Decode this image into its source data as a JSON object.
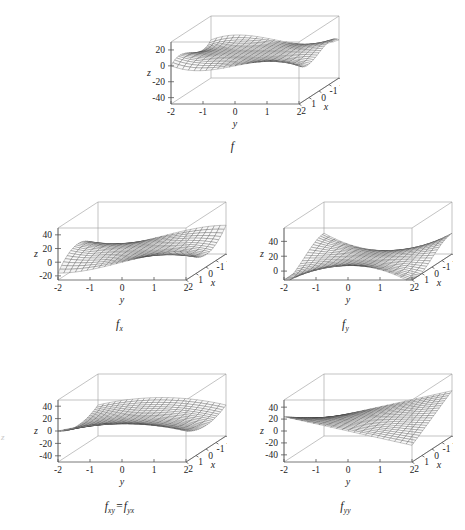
{
  "figure": {
    "title": "",
    "background_color": "#ffffff",
    "edge_artifact_text": "z"
  },
  "chart_data": [
    {
      "id": "f",
      "type": "surface",
      "caption": "f",
      "caption_base": "f",
      "caption_sub": "",
      "function": "f(x,y) = x^3*y - y^3*x",
      "xlabel": "x",
      "ylabel": "y",
      "zlabel": "z",
      "xticks": [
        2,
        1,
        0,
        -1,
        -2
      ],
      "xtick_labels": [
        "2",
        "1",
        "0",
        "-1",
        "-2"
      ],
      "yticks": [
        -2,
        -1,
        0,
        1,
        2
      ],
      "ytick_labels": [
        "-2",
        "-1",
        "0",
        "1",
        "2"
      ],
      "zticks": [
        20,
        0,
        -20,
        -40
      ],
      "ztick_labels": [
        "20",
        "0",
        "-20",
        "-40"
      ],
      "xlim": [
        -2,
        2
      ],
      "ylim": [
        -2,
        2
      ],
      "zlim": [
        -48,
        30
      ],
      "grid": false,
      "legend": "none",
      "mesh_color": "#3a3a3a",
      "box_color": "#9a9a9a"
    },
    {
      "id": "fx",
      "type": "surface",
      "caption": "fx",
      "caption_base": "f",
      "caption_sub": "x",
      "function": "f_x(x,y) = 3*x^2*y - y^3",
      "xlabel": "x",
      "ylabel": "y",
      "zlabel": "z",
      "xticks": [
        2,
        1,
        0,
        -1,
        -2
      ],
      "xtick_labels": [
        "2",
        "1",
        "0",
        "-1",
        "-2"
      ],
      "yticks": [
        -2,
        -1,
        0,
        1,
        2
      ],
      "ytick_labels": [
        "-2",
        "-1",
        "0",
        "1",
        "2"
      ],
      "zticks": [
        40,
        20,
        0,
        -20
      ],
      "ztick_labels": [
        "40",
        "20",
        "0",
        "-20"
      ],
      "xlim": [
        -2,
        2
      ],
      "ylim": [
        -2,
        2
      ],
      "zlim": [
        -26,
        50
      ],
      "grid": false,
      "legend": "none",
      "mesh_color": "#3a3a3a",
      "box_color": "#9a9a9a"
    },
    {
      "id": "fy",
      "type": "surface",
      "caption": "fy",
      "caption_base": "f",
      "caption_sub": "y",
      "function": "f_y(x,y) = x^3 - 3*y^2*x",
      "xlabel": "x",
      "ylabel": "y",
      "zlabel": "z",
      "xticks": [
        2,
        1,
        0,
        -1,
        -2
      ],
      "xtick_labels": [
        "2",
        "1",
        "0",
        "-1",
        "-2"
      ],
      "yticks": [
        -2,
        -1,
        0,
        1,
        2
      ],
      "ytick_labels": [
        "-2",
        "-1",
        "0",
        "1",
        "2"
      ],
      "zticks": [
        40,
        20,
        0
      ],
      "ztick_labels": [
        "40",
        "20",
        "0"
      ],
      "xlim": [
        -2,
        2
      ],
      "ylim": [
        -2,
        2
      ],
      "zlim": [
        -12,
        58
      ],
      "grid": false,
      "legend": "none",
      "mesh_color": "#3a3a3a",
      "box_color": "#9a9a9a"
    },
    {
      "id": "fxy",
      "type": "surface",
      "caption": "fxy = fyx",
      "caption_base": "f",
      "caption_sub": "xy",
      "caption_base2": "f",
      "caption_sub2": "yx",
      "caption_operator": "=",
      "function": "f_xy(x,y) = 3*x^2 - 3*y^2",
      "xlabel": "x",
      "ylabel": "y",
      "zlabel": "z",
      "xticks": [
        2,
        1,
        0,
        -1,
        -2
      ],
      "xtick_labels": [
        "2",
        "1",
        "0",
        "-1",
        "-2"
      ],
      "yticks": [
        -2,
        -1,
        0,
        1,
        2
      ],
      "ytick_labels": [
        "-2",
        "-1",
        "0",
        "1",
        "2"
      ],
      "zticks": [
        40,
        20,
        0,
        -20,
        -40
      ],
      "ztick_labels": [
        "40",
        "20",
        "0",
        "-20",
        "-40"
      ],
      "xlim": [
        -2,
        2
      ],
      "ylim": [
        -2,
        2
      ],
      "zlim": [
        -50,
        50
      ],
      "grid": false,
      "legend": "none",
      "mesh_color": "#3a3a3a",
      "box_color": "#9a9a9a"
    },
    {
      "id": "fyy",
      "type": "surface",
      "caption": "fyy",
      "caption_base": "f",
      "caption_sub": "yy",
      "function": "f_yy(x,y) = -6*x*y",
      "xlabel": "x",
      "ylabel": "y",
      "zlabel": "z",
      "xticks": [
        2,
        1,
        0,
        -1,
        -2
      ],
      "xtick_labels": [
        "2",
        "1",
        "0",
        "-1",
        "-2"
      ],
      "yticks": [
        -2,
        -1,
        0,
        1,
        2
      ],
      "ytick_labels": [
        "-2",
        "-1",
        "0",
        "1",
        "2"
      ],
      "zticks": [
        40,
        20,
        0,
        -20,
        -40
      ],
      "ztick_labels": [
        "40",
        "20",
        "0",
        "-20",
        "-40"
      ],
      "xlim": [
        -2,
        2
      ],
      "ylim": [
        -2,
        2
      ],
      "zlim": [
        -52,
        52
      ],
      "grid": false,
      "legend": "none",
      "mesh_color": "#3a3a3a",
      "box_color": "#9a9a9a"
    }
  ],
  "layout": {
    "cells": [
      {
        "id": "f",
        "left": 125,
        "top": 2,
        "width": 215,
        "height": 140,
        "caption_top": 140
      },
      {
        "id": "fx",
        "left": 12,
        "top": 188,
        "width": 215,
        "height": 130,
        "caption_top": 318
      },
      {
        "id": "fy",
        "left": 238,
        "top": 188,
        "width": 215,
        "height": 130,
        "caption_top": 318
      },
      {
        "id": "fxy",
        "left": 12,
        "top": 360,
        "width": 215,
        "height": 140,
        "caption_top": 500
      },
      {
        "id": "fyy",
        "left": 238,
        "top": 360,
        "width": 215,
        "height": 140,
        "caption_top": 500
      }
    ]
  }
}
